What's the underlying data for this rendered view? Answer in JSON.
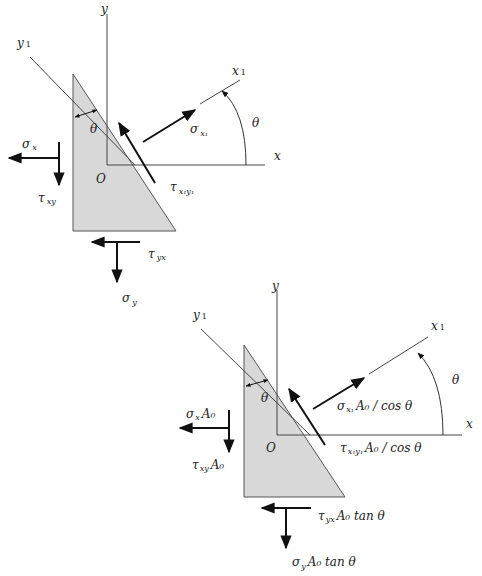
{
  "colors": {
    "background": "#ffffff",
    "triangle_fill": "#d8d8d8",
    "line": "#333333",
    "arrow": "#111111"
  },
  "diagram_top": {
    "axis_y": "y",
    "axis_y1": "y",
    "axis_y1_sub": "1",
    "axis_x": "x",
    "axis_x1": "x",
    "axis_x1_sub": "1",
    "origin": "O",
    "theta_inner": "θ",
    "theta_arc": "θ",
    "sigma_x": {
      "sym": "σ",
      "sub": "x"
    },
    "tau_xy": {
      "sym": "τ",
      "sub": "xy"
    },
    "tau_yx": {
      "sym": "τ",
      "sub": "yx"
    },
    "sigma_y": {
      "sym": "σ",
      "sub": "y"
    },
    "sigma_x1": {
      "sym": "σ",
      "sub": "x₁"
    },
    "tau_x1y1": {
      "sym": "τ",
      "sub": "x₁y₁"
    }
  },
  "diagram_bottom": {
    "axis_y": "y",
    "axis_y1": "y",
    "axis_y1_sub": "1",
    "axis_x": "x",
    "axis_x1": "x",
    "axis_x1_sub": "1",
    "origin": "O",
    "theta_inner": "θ",
    "theta_arc": "θ",
    "sigma_x": {
      "sym": "σ",
      "sub": "x",
      "tail": "A₀"
    },
    "tau_xy": {
      "sym": "τ",
      "sub": "xy",
      "tail": "A₀"
    },
    "tau_yx": {
      "sym": "τ",
      "sub": "yx",
      "tail": "A₀ tan θ"
    },
    "sigma_y": {
      "sym": "σ",
      "sub": "y",
      "tail": "A₀ tan θ"
    },
    "sigma_x1": {
      "sym": "σ",
      "sub": "x₁",
      "tail": "A₀ / cos θ"
    },
    "tau_x1y1": {
      "sym": "τ",
      "sub": "x₁y₁",
      "tail": "A₀ / cos θ"
    }
  }
}
